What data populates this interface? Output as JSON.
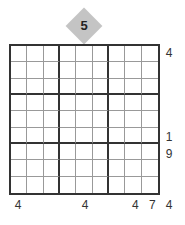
{
  "puzzle": {
    "top_clue": "5",
    "right_clues": [
      {
        "row": 0,
        "value": "4"
      },
      {
        "row": 5,
        "value": "1"
      },
      {
        "row": 6,
        "value": "9"
      }
    ],
    "bottom_clues": [
      {
        "col": 0,
        "value": "4"
      },
      {
        "col": 4,
        "value": "4"
      },
      {
        "col": 7,
        "value": "4"
      },
      {
        "col": 8,
        "value": "7"
      },
      {
        "col": 9,
        "value": "4"
      }
    ],
    "grid_size": 9
  }
}
